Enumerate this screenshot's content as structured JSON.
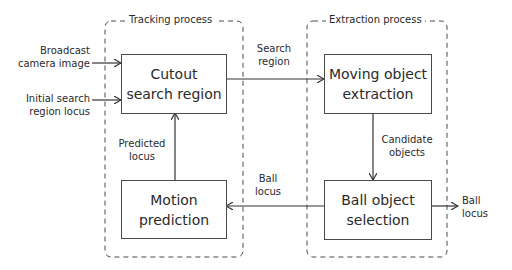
{
  "diagram": {
    "groups": [
      {
        "id": "tracking",
        "title": "Tracking process"
      },
      {
        "id": "extraction",
        "title": "Extraction process"
      }
    ],
    "blocks": {
      "cutout": {
        "line1": "Cutout",
        "line2": "search region"
      },
      "motion": {
        "line1": "Motion",
        "line2": "prediction"
      },
      "moving": {
        "line1": "Moving object",
        "line2": "extraction"
      },
      "ball": {
        "line1": "Ball object",
        "line2": "selection"
      }
    },
    "edge_labels": {
      "broadcast": {
        "line1": "Broadcast",
        "line2": "camera image"
      },
      "initial": {
        "line1": "Initial search",
        "line2": "region locus"
      },
      "search_region": {
        "line1": "Search",
        "line2": "region"
      },
      "predicted_locus": {
        "line1": "Predicted",
        "line2": "locus"
      },
      "candidate_objects": {
        "line1": "Candidate",
        "line2": "objects"
      },
      "ball_locus_mid": {
        "line1": "Ball",
        "line2": "locus"
      },
      "ball_locus_out": {
        "line1": "Ball",
        "line2": "locus"
      }
    },
    "edges": [
      {
        "from": "Broadcast camera image",
        "to": "Cutout search region"
      },
      {
        "from": "Initial search region locus",
        "to": "Cutout search region"
      },
      {
        "from": "Cutout search region",
        "to": "Moving object extraction",
        "label": "Search region"
      },
      {
        "from": "Moving object extraction",
        "to": "Ball object selection",
        "label": "Candidate objects"
      },
      {
        "from": "Ball object selection",
        "to": "Motion prediction",
        "label": "Ball locus"
      },
      {
        "from": "Motion prediction",
        "to": "Cutout search region",
        "label": "Predicted locus"
      },
      {
        "from": "Ball object selection",
        "to": "output",
        "label": "Ball locus"
      }
    ],
    "colors": {
      "line": "#3a3a3a",
      "dash": "#4a4a4a",
      "background": "#ffffff"
    }
  }
}
